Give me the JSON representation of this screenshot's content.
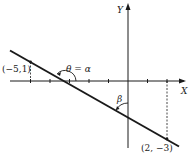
{
  "diagram": {
    "type": "coordinate-plane-line",
    "axes": {
      "x_label": "X",
      "y_label": "Y"
    },
    "points": [
      {
        "label": "(−5,1)",
        "x": -5,
        "y": 1
      },
      {
        "label": "(2, −3)",
        "x": 2,
        "y": -3
      }
    ],
    "angles": {
      "theta_label": "θ = α",
      "beta_label": "β"
    },
    "colors": {
      "ink": "#1a1a1a",
      "background": "#ffffff"
    }
  }
}
